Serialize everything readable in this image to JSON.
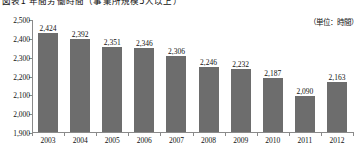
{
  "chart_title": "図表1 年間労働時間（事業所規模5人以上）",
  "unit_note": "（単位：時間）",
  "chart_data": {
    "type": "bar",
    "title": "図表1 年間労働時間（事業所規模5人以上）",
    "subtitle": "（単位：時間）",
    "xlabel": "",
    "ylabel": "",
    "ylim": [
      1900,
      2500
    ],
    "ytick_step": 100,
    "ytick_labels": [
      "2,500",
      "2,400",
      "2,300",
      "2,200",
      "2,100",
      "2,000",
      "1,900"
    ],
    "ytick_values": [
      2500,
      2400,
      2300,
      2200,
      2100,
      2000,
      1900
    ],
    "grid": false,
    "legend": "none",
    "bar_color": "#6d6d6d",
    "categories": [
      "2003",
      "2004",
      "2005",
      "2006",
      "2007",
      "2008",
      "2009",
      "2010",
      "2011",
      "2012"
    ],
    "values": [
      2424,
      2392,
      2351,
      2346,
      2306,
      2246,
      2232,
      2187,
      2090,
      2163
    ],
    "value_labels": [
      "2,424",
      "2,392",
      "2,351",
      "2,346",
      "2,306",
      "2,246",
      "2,232",
      "2,187",
      "2,090",
      "2,163"
    ]
  }
}
